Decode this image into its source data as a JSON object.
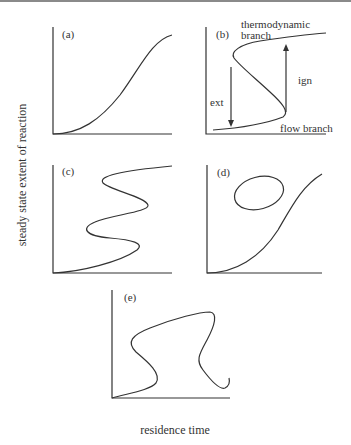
{
  "figure": {
    "y_axis_label": "steady state extent of reaction",
    "x_axis_label": "residence time"
  },
  "panels": {
    "a": {
      "label": "(a)",
      "description": "monotonic sigmoidal curve"
    },
    "b": {
      "label": "(b)",
      "description": "S-shaped curve with ignition and extinction",
      "annotations": {
        "thermodynamic_line1": "thermodynamic",
        "thermodynamic_line2": "branch",
        "flow": "flow branch",
        "ignition": "ign",
        "extinction": "ext"
      }
    },
    "c": {
      "label": "(c)",
      "description": "double S-shaped curve (multiple hysteresis)"
    },
    "d": {
      "label": "(d)",
      "description": "sigmoidal curve with isolated ellipse (isola)"
    },
    "e": {
      "label": "(e)",
      "description": "mushroom-shaped curve"
    }
  },
  "colors": {
    "line": "#333333",
    "background": "#ffffff",
    "top_rule": "#8a8a8a"
  }
}
